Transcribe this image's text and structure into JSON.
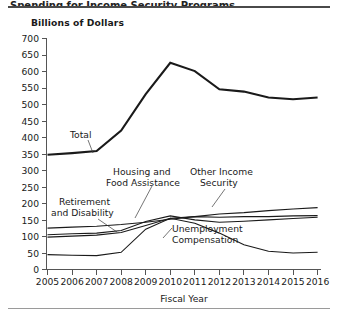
{
  "figure": {
    "title_partial": "Spending for Income Security Programs",
    "y_axis_unit_label": "Billions of Dollars",
    "x_axis_title": "Fiscal Year"
  },
  "chart_data": {
    "type": "line",
    "title": "Spending for Income Security Programs",
    "xlabel": "Fiscal Year",
    "ylabel": "Billions of Dollars",
    "x": [
      2005,
      2006,
      2007,
      2008,
      2009,
      2010,
      2011,
      2012,
      2013,
      2014,
      2015,
      2016
    ],
    "xlim": [
      2005,
      2016
    ],
    "ylim": [
      0,
      700
    ],
    "yticks": [
      0,
      50,
      100,
      150,
      200,
      250,
      300,
      350,
      400,
      450,
      500,
      550,
      600,
      650,
      700
    ],
    "xticks": [
      "2005",
      "2006",
      "2007",
      "2008",
      "2009",
      "2010",
      "2011",
      "2012",
      "2013",
      "2014",
      "2015",
      "2016"
    ],
    "grid": false,
    "legend": "inline-annotations",
    "series": [
      {
        "name": "Total",
        "values": [
          347,
          352,
          358,
          420,
          530,
          625,
          600,
          545,
          538,
          520,
          515,
          520
        ]
      },
      {
        "name": "Retirement and Disability",
        "values": [
          125,
          128,
          131,
          136,
          143,
          152,
          160,
          168,
          172,
          178,
          183,
          187
        ]
      },
      {
        "name": "Housing and Food Assistance",
        "values": [
          98,
          101,
          104,
          112,
          133,
          155,
          160,
          158,
          160,
          160,
          162,
          163
        ]
      },
      {
        "name": "Other Income Security",
        "values": [
          105,
          108,
          110,
          118,
          145,
          162,
          150,
          143,
          146,
          150,
          154,
          158
        ]
      },
      {
        "name": "Unemployment Compensation",
        "values": [
          45,
          43,
          42,
          52,
          122,
          155,
          140,
          110,
          75,
          55,
          50,
          52
        ]
      }
    ],
    "annotations": [
      {
        "text": "Total",
        "lines": [
          "Total"
        ]
      },
      {
        "text": "Retirement and Disability",
        "lines": [
          "Retirement",
          "and Disability"
        ]
      },
      {
        "text": "Housing and Food Assistance",
        "lines": [
          "Housing and",
          "Food Assistance"
        ]
      },
      {
        "text": "Other Income Security",
        "lines": [
          "Other Income",
          "Security"
        ]
      },
      {
        "text": "Unemployment Compensation",
        "lines": [
          "Unemployment",
          "Compensation"
        ]
      }
    ]
  }
}
